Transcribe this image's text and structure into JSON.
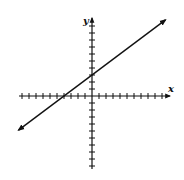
{
  "chart_data": {
    "type": "line",
    "title": "",
    "xlabel": "x",
    "ylabel": "y",
    "xlim": [
      -10,
      10
    ],
    "ylim": [
      -10,
      10
    ],
    "grid": false,
    "x_ticks_unlabeled": [
      -10,
      -9,
      -8,
      -7,
      -6,
      -5,
      -4,
      -3,
      -2,
      -1,
      1,
      2,
      3,
      4,
      5,
      6,
      7,
      8,
      9,
      10
    ],
    "y_ticks_unlabeled": [
      -10,
      -9,
      -8,
      -7,
      -6,
      -5,
      -4,
      -3,
      -2,
      -1,
      1,
      2,
      3,
      4,
      5,
      6,
      7,
      8,
      9,
      10
    ],
    "series": [
      {
        "name": "line",
        "equation": "y = 0.75x + 3",
        "slope": 0.75,
        "y_intercept": 3,
        "x_intercept": -4,
        "x": [
          -10.5,
          10.5
        ],
        "y": [
          -4.875,
          10.875
        ],
        "arrows_both_ends": true
      }
    ],
    "color": "#111111"
  }
}
